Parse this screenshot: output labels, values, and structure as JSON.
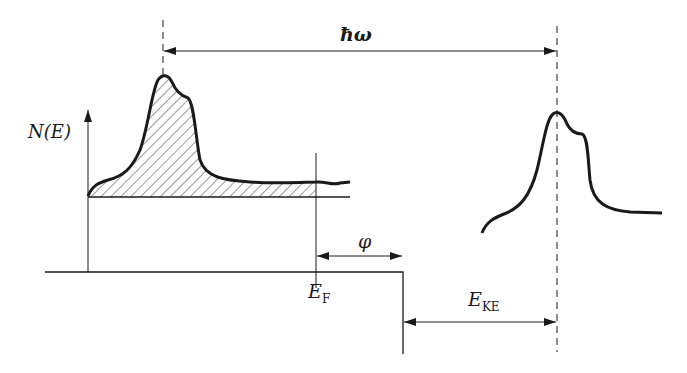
{
  "figure": {
    "labels": {
      "density_of_states": "N(E)",
      "photon_energy": "ħω",
      "work_function": "φ",
      "fermi_energy_main": "E",
      "fermi_energy_sub": "F",
      "kinetic_energy_main": "E",
      "kinetic_energy_sub": "KE"
    },
    "colors": {
      "line": "#1a1a1a",
      "background": "#ffffff"
    }
  }
}
